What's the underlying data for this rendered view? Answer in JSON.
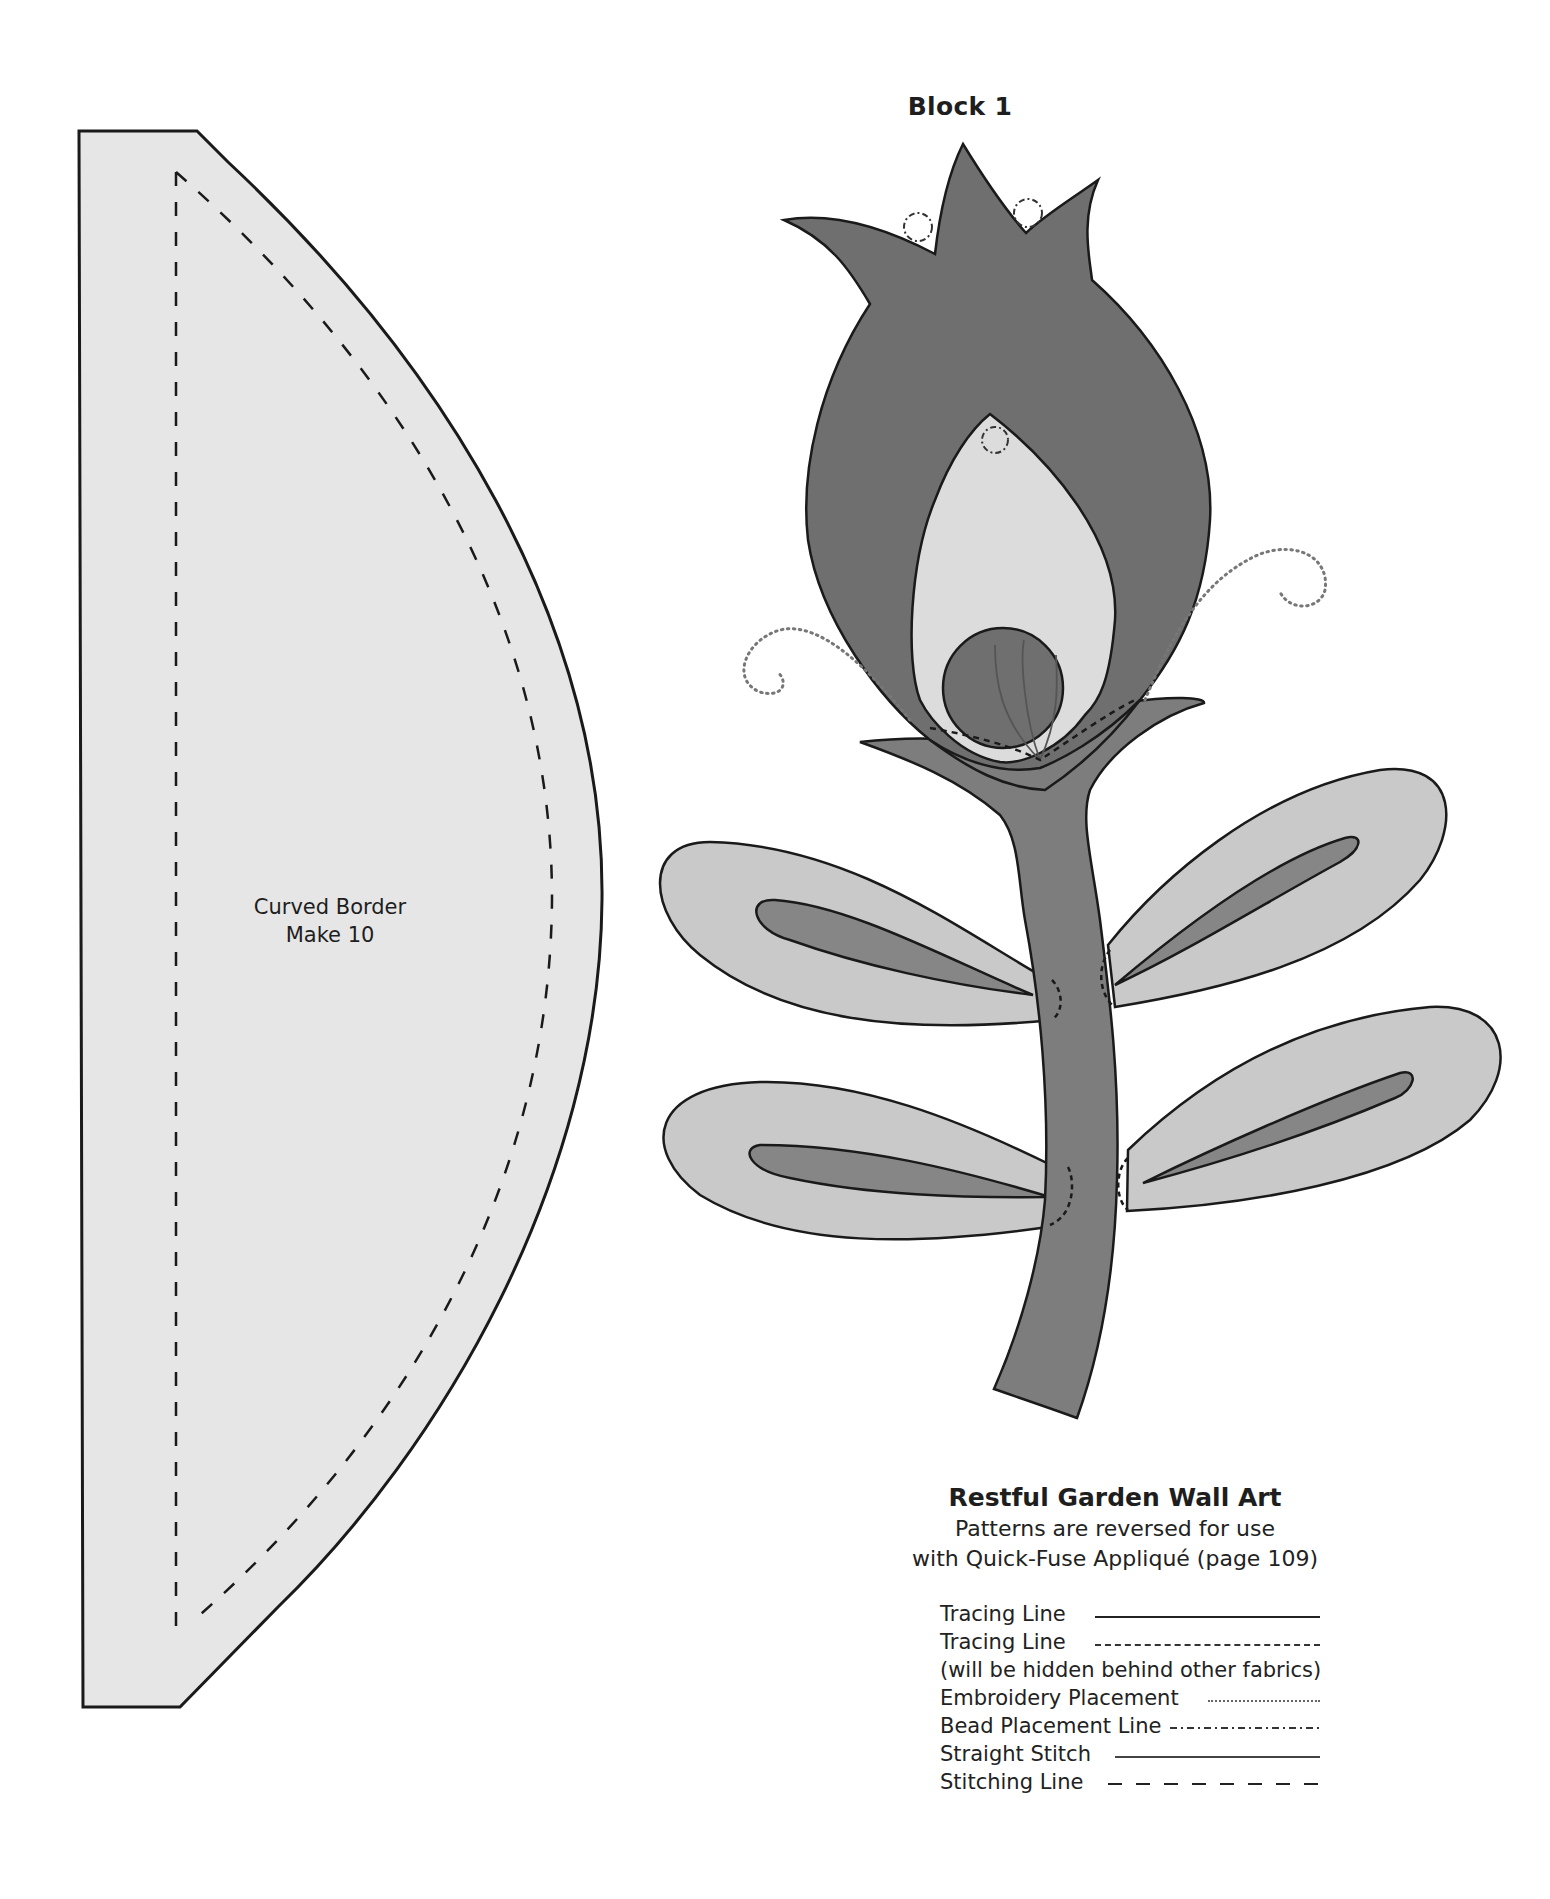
{
  "page": {
    "block_title": "Block 1",
    "background": "#ffffff"
  },
  "curved_border": {
    "label_line1": "Curved Border",
    "label_line2": "Make 10",
    "fill": "#e6e6e6"
  },
  "flower": {
    "head_color": "#6f6f6f",
    "stem_color": "#7d7d7d",
    "bud_color": "#dcdcdc",
    "leaf_color": "#c9c9c9",
    "leaf_vein_color": "#868686"
  },
  "info": {
    "title": "Restful Garden Wall Art",
    "subtitle_line1": "Patterns are reversed for use",
    "subtitle_line2": "with Quick-Fuse Appliqué (page 109)"
  },
  "legend": {
    "items": [
      {
        "label": "Tracing Line",
        "style": "solid"
      },
      {
        "label": "Tracing Line",
        "style": "fine-dashed"
      },
      {
        "label": "(will be hidden behind other fabrics)",
        "style": "none"
      },
      {
        "label": "Embroidery Placement",
        "style": "dotted"
      },
      {
        "label": "Bead Placement Line",
        "style": "dash-dot"
      },
      {
        "label": "Straight Stitch",
        "style": "solid"
      },
      {
        "label": "Stitching Line",
        "style": "long-dashed"
      }
    ]
  }
}
